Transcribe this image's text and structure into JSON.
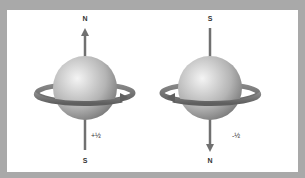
{
  "diagram": {
    "left": {
      "top_pole": "N",
      "bottom_pole": "S",
      "spin": "+½",
      "arrow_direction": "up"
    },
    "right": {
      "top_pole": "S",
      "bottom_pole": "N",
      "spin": "-½",
      "arrow_direction": "down"
    }
  },
  "colors": {
    "frame": "#a9a9a9",
    "background": "#ffffff",
    "arrow": "#6f6f6f",
    "sphere_light": "#f2f2f2",
    "sphere_dark": "#7a7a7a"
  }
}
